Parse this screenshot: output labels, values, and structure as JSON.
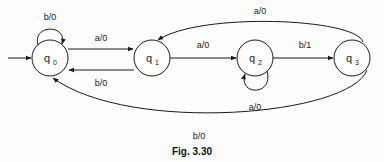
{
  "figure": {
    "caption": "Fig. 3.30",
    "type": "state-transition-diagram",
    "title": ""
  },
  "states": [
    {
      "id": "q0",
      "label": "q",
      "sub": "0",
      "cx": 50,
      "cy": 58,
      "r": 18,
      "initial": true
    },
    {
      "id": "q1",
      "label": "q",
      "sub": "1",
      "cx": 152,
      "cy": 58,
      "r": 18,
      "initial": false
    },
    {
      "id": "q2",
      "label": "q",
      "sub": "2",
      "cx": 255,
      "cy": 58,
      "r": 18,
      "initial": false
    },
    {
      "id": "q3",
      "label": "q",
      "sub": "3",
      "cx": 352,
      "cy": 58,
      "r": 18,
      "initial": false
    }
  ],
  "transitions": [
    {
      "from": "q0",
      "to": "q0",
      "label": "b/0",
      "kind": "self-loop-top",
      "lx": 50,
      "ly": 20
    },
    {
      "from": "q0",
      "to": "q1",
      "label": "a/0",
      "kind": "straight-top",
      "lx": 101,
      "ly": 41
    },
    {
      "from": "q1",
      "to": "q0",
      "label": "b/0",
      "kind": "straight-bottom",
      "lx": 101,
      "ly": 86
    },
    {
      "from": "q1",
      "to": "q2",
      "label": "a/0",
      "kind": "straight",
      "lx": 203,
      "ly": 48
    },
    {
      "from": "q2",
      "to": "q2",
      "label": "a/0",
      "kind": "self-loop-bottom",
      "lx": 255,
      "ly": 110
    },
    {
      "from": "q2",
      "to": "q3",
      "label": "b/1",
      "kind": "straight",
      "lx": 305,
      "ly": 48
    },
    {
      "from": "q3",
      "to": "q1",
      "label": "a/0",
      "kind": "curve-top",
      "lx": 260,
      "ly": 14
    },
    {
      "from": "q3",
      "to": "q0",
      "label": "b/0",
      "kind": "curve-bottom",
      "lx": 199,
      "ly": 139
    }
  ],
  "alphabet": {
    "inputs": [
      "a",
      "b"
    ],
    "outputs": [
      "0",
      "1"
    ]
  },
  "colors": {
    "ink": "#1b1b1b",
    "background": "#fdfdfc"
  }
}
